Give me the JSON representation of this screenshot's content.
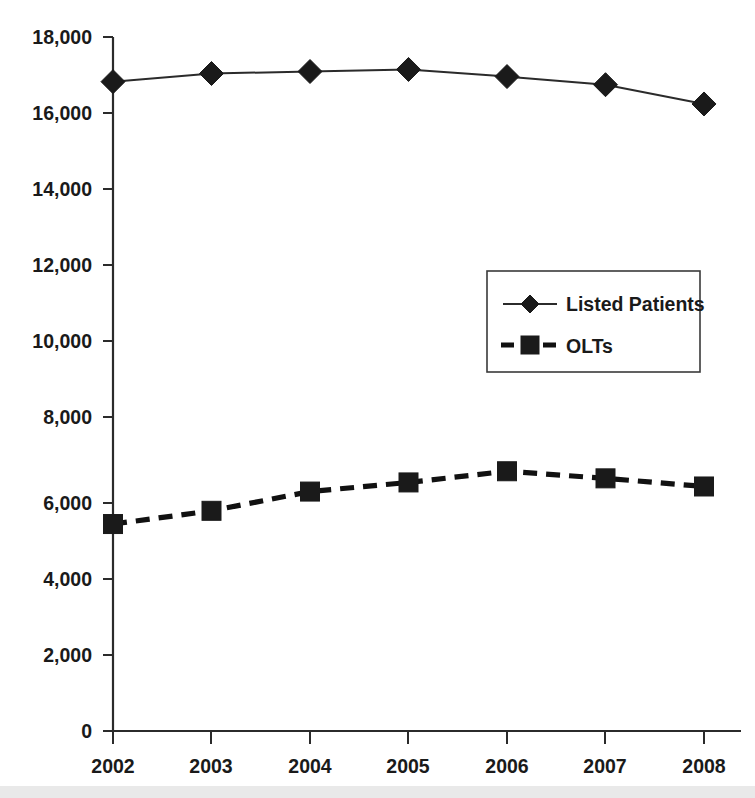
{
  "chart_data": {
    "type": "line",
    "title": "",
    "subtitle": "",
    "xlabel": "",
    "ylabel": "",
    "categories": [
      "2002",
      "2003",
      "2004",
      "2005",
      "2006",
      "2007",
      "2008"
    ],
    "x": [
      2002,
      2003,
      2004,
      2005,
      2006,
      2007,
      2008
    ],
    "series": [
      {
        "name": "Listed Patients",
        "marker": "diamond",
        "line_style": "solid",
        "color": "#1a1a1a",
        "values": [
          16842,
          17053,
          17105,
          17158,
          16974,
          16763,
          16263
        ]
      },
      {
        "name": "OLTs",
        "marker": "square",
        "line_style": "dashed",
        "color": "#111111",
        "values": [
          5368,
          5711,
          6210,
          6447,
          6737,
          6553,
          6342
        ]
      }
    ],
    "ylim": [
      0,
      18000
    ],
    "ytick_values": [
      0,
      2000,
      4000,
      6000,
      8000,
      10000,
      12000,
      14000,
      16000,
      18000
    ],
    "ytick_labels": [
      "0",
      "2,000",
      "4,000",
      "6,000",
      "8,000",
      "10,000",
      "12,000",
      "14,000",
      "16,000",
      "18,000"
    ],
    "xtick_labels": [
      "2002",
      "2003",
      "2004",
      "2005",
      "2006",
      "2007",
      "2008"
    ],
    "grid": false,
    "legend_position": "center-right",
    "legend_entries": [
      "Listed Patients",
      "OLTs"
    ]
  },
  "axes": {
    "y_axis_name": "y-axis",
    "x_axis_name": "x-axis"
  },
  "legend": {
    "items": [
      {
        "label": "Listed Patients",
        "marker": "diamond-marker-icon",
        "style": "solid"
      },
      {
        "label": "OLTs",
        "marker": "square-marker-icon",
        "style": "dashed"
      }
    ]
  },
  "colors": {
    "ink": "#1a1a1a",
    "axis": "#2b2b2b",
    "background": "#ffffff",
    "bottom_band": "#e9e9e9"
  }
}
